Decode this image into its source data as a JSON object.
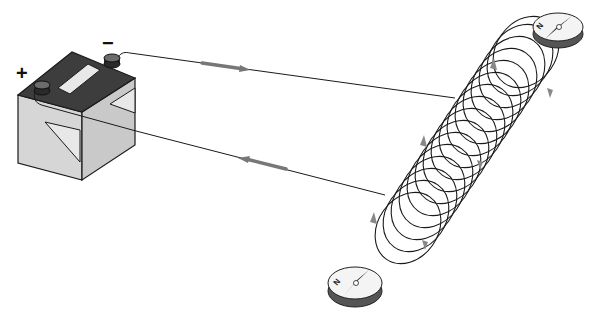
{
  "diagram": {
    "title": "",
    "battery": {
      "positive_label": "+",
      "negative_label": "−"
    },
    "compass_top": {
      "needle_label": "N"
    },
    "compass_bottom": {
      "needle_label": "N"
    },
    "colors": {
      "battery_top": "#3d3d3d",
      "battery_front": "#d6d6d6",
      "battery_side": "#c4c4c4",
      "wire": "#1a1a1a",
      "arrow": "#777777",
      "coil": "#1a1a1a",
      "compass_rim": "#555555",
      "compass_face": "#f4f4f4"
    },
    "current_arrows": [
      {
        "position": "top-wire",
        "direction": "right"
      },
      {
        "position": "bottom-wire",
        "direction": "left"
      }
    ],
    "coil_turns": 16
  }
}
